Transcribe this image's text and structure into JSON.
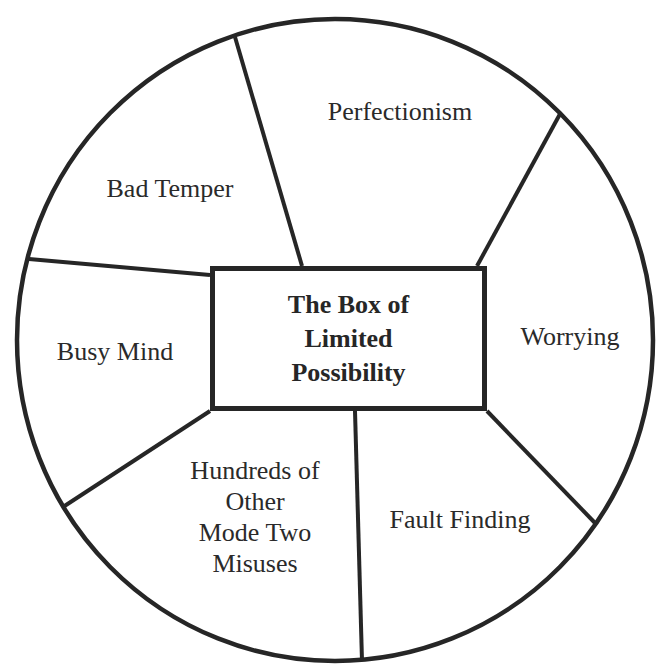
{
  "diagram": {
    "type": "segmented-circle",
    "colors": {
      "stroke": "#262626",
      "text": "#2a2a2a",
      "background": "#ffffff"
    },
    "center_box": {
      "lines": [
        "The Box of",
        "Limited",
        "Possibility"
      ]
    },
    "segments": [
      {
        "id": "perfectionism",
        "lines": [
          "Perfectionism"
        ]
      },
      {
        "id": "worrying",
        "lines": [
          "Worrying"
        ]
      },
      {
        "id": "fault-finding",
        "lines": [
          "Fault Finding"
        ]
      },
      {
        "id": "hundreds-of-other-misuses",
        "lines": [
          "Hundreds of",
          "Other",
          "Mode Two",
          "Misuses"
        ]
      },
      {
        "id": "busy-mind",
        "lines": [
          "Busy Mind"
        ]
      },
      {
        "id": "bad-temper",
        "lines": [
          "Bad Temper"
        ]
      }
    ]
  }
}
